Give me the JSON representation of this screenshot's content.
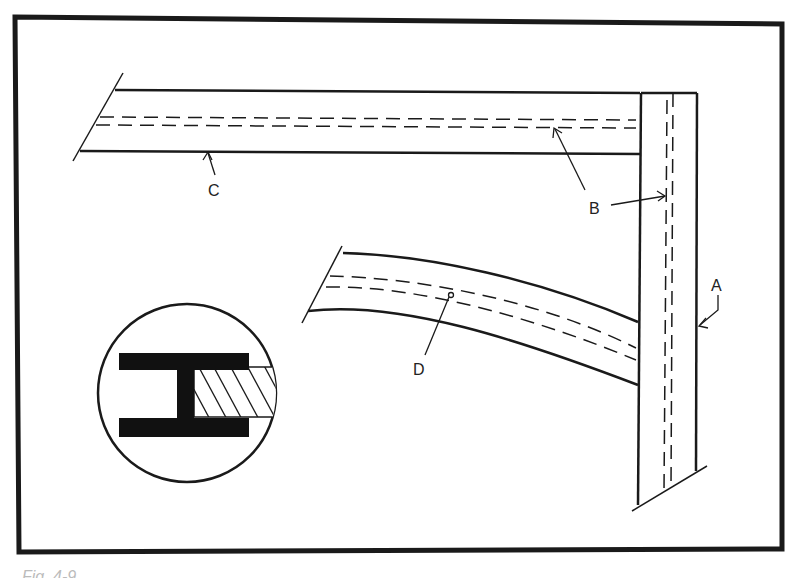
{
  "figure": {
    "labels": {
      "A": "A",
      "B": "B",
      "C": "C",
      "D": "D"
    },
    "parts": {
      "A": "vertical post",
      "B": "glue line / dowel path",
      "C": "horizontal rail",
      "D": "curved brace"
    },
    "inset": "cross-section detail of joint"
  },
  "caption": "Fig. 4-9."
}
